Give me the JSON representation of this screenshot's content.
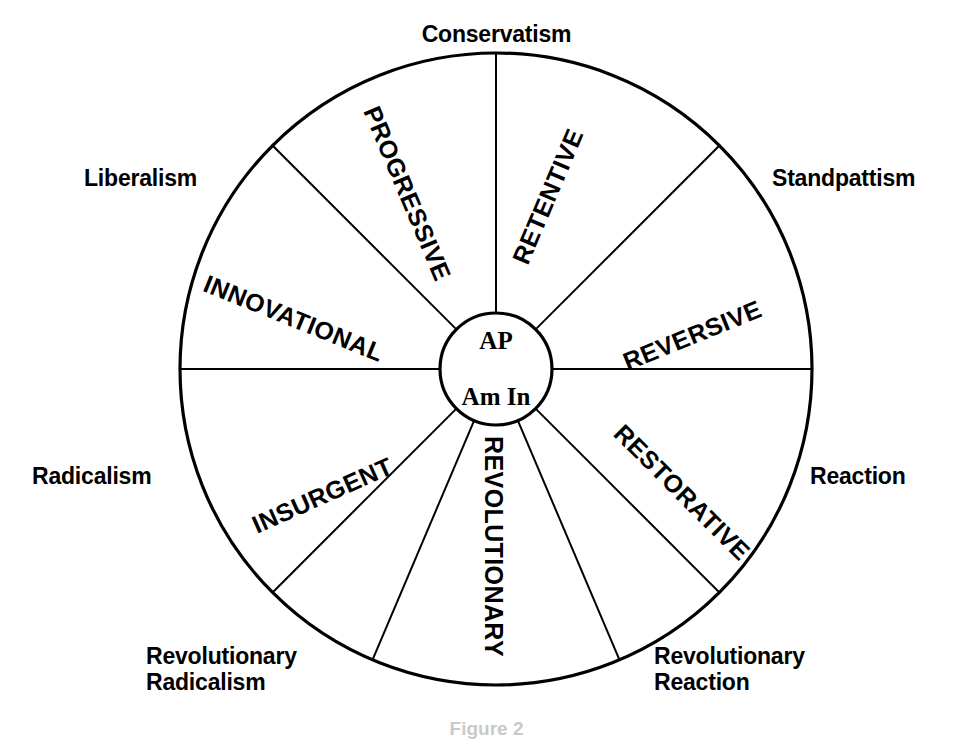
{
  "figure": {
    "caption": "Figure 2",
    "hub": {
      "line1": "AP",
      "line2": "Am In"
    },
    "geometry": {
      "center_x": 496,
      "center_y": 369,
      "outer_radius": 316,
      "hub_radius": 56
    },
    "colors": {
      "stroke": "#000000",
      "background": "#ffffff",
      "text": "#000000"
    }
  },
  "rim_labels": [
    {
      "text": "Conservatism",
      "angle_deg": 0,
      "x": 404,
      "y": 22,
      "align": "center"
    },
    {
      "text": "Standpattism",
      "angle_deg": 45,
      "x": 772,
      "y": 166,
      "align": "left"
    },
    {
      "text": "Reaction",
      "angle_deg": 90,
      "x": 810,
      "y": 464,
      "align": "left"
    },
    {
      "text": "Revolutionary\nReaction",
      "angle_deg": 135,
      "x": 654,
      "y": 644,
      "align": "left"
    },
    {
      "text": "Revolutionary\nRadicalism",
      "angle_deg": 225,
      "x": 146,
      "y": 644,
      "align": "left"
    },
    {
      "text": "Radicalism",
      "angle_deg": 270,
      "x": 32,
      "y": 464,
      "align": "left"
    },
    {
      "text": "Liberalism",
      "angle_deg": 315,
      "x": 84,
      "y": 166,
      "align": "left"
    }
  ],
  "sector_labels": [
    {
      "text": "RETENTIVE",
      "rotation_deg": -67,
      "cx": 548,
      "cy": 196,
      "font_size": 25
    },
    {
      "text": "REVERSIVE",
      "rotation_deg": -22,
      "cx": 692,
      "cy": 335,
      "font_size": 25
    },
    {
      "text": "RESTORATIVE",
      "rotation_deg": 45,
      "cx": 682,
      "cy": 492,
      "font_size": 25
    },
    {
      "text": "REVOLUTIONARY",
      "rotation_deg": 90,
      "cx": 493,
      "cy": 546,
      "font_size": 25
    },
    {
      "text": "INSURGENT",
      "rotation_deg": -24,
      "cx": 322,
      "cy": 495,
      "font_size": 25
    },
    {
      "text": "INNOVATIONAL",
      "rotation_deg": 22,
      "cx": 293,
      "cy": 318,
      "font_size": 25
    },
    {
      "text": "PROGRESSIVE",
      "rotation_deg": 67,
      "cx": 407,
      "cy": 193,
      "font_size": 25
    }
  ],
  "spokes": [
    {
      "name": "spoke-conservatism",
      "angle_deg": 0
    },
    {
      "name": "spoke-standpattism",
      "angle_deg": 45
    },
    {
      "name": "spoke-reaction",
      "angle_deg": 90
    },
    {
      "name": "spoke-revolutionary-reaction",
      "angle_deg": 135
    },
    {
      "name": "spoke-revolutionary-bottom-right",
      "angle_deg": 157
    },
    {
      "name": "spoke-revolutionary-bottom-left",
      "angle_deg": 203
    },
    {
      "name": "spoke-revolutionary-radicalism",
      "angle_deg": 225
    },
    {
      "name": "spoke-radicalism",
      "angle_deg": 270
    },
    {
      "name": "spoke-liberalism",
      "angle_deg": 315
    }
  ],
  "chart_data": {
    "type": "pie",
    "center_label": "AP Am In",
    "legend_position": "around-rim",
    "grid": false,
    "categories": [
      "RETENTIVE",
      "REVERSIVE",
      "RESTORATIVE",
      "REVOLUTIONARY",
      "INSURGENT",
      "INNOVATIONAL",
      "PROGRESSIVE"
    ],
    "values": [
      45,
      45,
      22,
      46,
      22,
      45,
      45
    ],
    "boundary_labels": [
      "Conservatism",
      "Standpattism",
      "Reaction",
      "Revolutionary Reaction",
      "Revolutionary Radicalism",
      "Radicalism",
      "Liberalism"
    ],
    "sector_boundaries_deg": [
      0,
      45,
      90,
      135,
      157,
      203,
      225,
      270,
      315
    ]
  }
}
